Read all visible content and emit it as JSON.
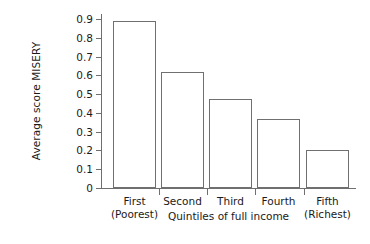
{
  "chart_data": {
    "type": "bar",
    "title": "",
    "subtitle": "",
    "xlabel": "Quintiles of full income",
    "ylabel": "Average score MISERY",
    "categories": [
      "First (Poorest)",
      "Second",
      "Third",
      "Fourth",
      "Fifth (Richest)"
    ],
    "category_lines": [
      [
        "First",
        "(Poorest)"
      ],
      [
        "Second",
        ""
      ],
      [
        "Third",
        ""
      ],
      [
        "Fourth",
        ""
      ],
      [
        "Fifth",
        "(Richest)"
      ]
    ],
    "values": [
      0.89,
      0.62,
      0.475,
      0.365,
      0.205
    ],
    "ylim": [
      0,
      0.9
    ],
    "ytick_labels": [
      "0.9",
      "0.8",
      "0.7",
      "0.6",
      "0.5",
      "0.4",
      "0.3",
      "0.2",
      "0.1",
      "0"
    ],
    "ytick_values": [
      0.9,
      0.8,
      0.7,
      0.6,
      0.5,
      0.4,
      0.3,
      0.2,
      0.1,
      0
    ],
    "grid": false,
    "legend": null,
    "legend_position": "none",
    "annotations": [],
    "bar_style": {
      "fill": "#ffffff",
      "outline": "#707070",
      "outline_width_px": 1
    },
    "axis_color": "#6f6f6f",
    "background": "#ffffff",
    "text_color": "#1a1a1a"
  }
}
